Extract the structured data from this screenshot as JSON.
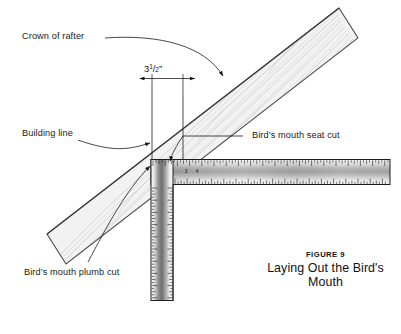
{
  "figure": {
    "number_label": "FIGURE 9",
    "caption": "Laying Out the Bird's Mouth"
  },
  "dimension": {
    "whole": "3",
    "numerator": "1",
    "slash": "/",
    "denominator": "2",
    "unit": "”",
    "full_text": "3 1/2”"
  },
  "annotations": [
    {
      "id": "crown-of-rafter",
      "text": "Crown of rafter"
    },
    {
      "id": "building-line",
      "text": "Building line"
    },
    {
      "id": "birds-mouth-seat-cut",
      "text": "Bird’s mouth seat cut"
    },
    {
      "id": "birds-mouth-plumb-cut",
      "text": "Bird’s mouth plumb cut"
    }
  ],
  "square": {
    "blade_numerals": [
      "3",
      "4"
    ]
  },
  "colors": {
    "ink": "#1a1a1a",
    "rafter_fill": "#f2f2f2",
    "rafter_outline": "#4a4a4a",
    "grain": "#b9b9b9",
    "square_edge": "#1c1c1c",
    "tick": "#1c1c1c",
    "background": "#ffffff"
  }
}
